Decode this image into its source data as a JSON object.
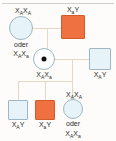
{
  "diagram": {
    "language_note": "oder",
    "colors": {
      "affected_fill": "#ef7040",
      "affected_border": "#d45c2c",
      "unaffected_fill": "#e6f3f8",
      "unaffected_border": "#9fb7c4",
      "carrier_fill": "#fbfdfe",
      "carrier_dot": "#111111",
      "connector_line": "#e3d9c4",
      "background": "#fdfcfa",
      "top_rule": "#cfcfcf"
    }
  },
  "generation1": {
    "mother": {
      "shape": "circle",
      "status": "unaffected",
      "genotype_primary": "X",
      "genotype_primary_sub1": "A",
      "genotype_primary_mid": "X",
      "genotype_primary_sub2": "A",
      "label_top": "XAXA",
      "or_word": "oder",
      "genotype_alt": "XAXa",
      "alt_sub1": "A",
      "alt_sub2": "a"
    },
    "father": {
      "shape": "square",
      "status": "affected",
      "label_top": "XaY",
      "sub": "a",
      "tail": "Y"
    }
  },
  "generation2": {
    "daughter_carrier": {
      "shape": "circle-with-dot",
      "status": "carrier",
      "label_bottom": "XAXa",
      "sub1": "A",
      "sub2": "a"
    },
    "spouse": {
      "shape": "square",
      "status": "unaffected",
      "label_bottom": "XAY",
      "sub": "A",
      "tail": "Y"
    }
  },
  "generation3": {
    "children": [
      {
        "shape": "square",
        "status": "unaffected",
        "label": "XAY",
        "sub": "A",
        "tail": "Y"
      },
      {
        "shape": "square",
        "status": "affected",
        "label": "XaY",
        "sub": "a",
        "tail": "Y"
      },
      {
        "shape": "circle",
        "status": "unaffected-or-carrier",
        "label_top": "XAXA",
        "top_sub1": "A",
        "top_sub2": "A",
        "or_word": "oder",
        "label_alt": "XAXa",
        "alt_sub1": "A",
        "alt_sub2": "a"
      }
    ]
  },
  "glyph": {
    "x_letter": "X",
    "y_letter": "Y"
  }
}
